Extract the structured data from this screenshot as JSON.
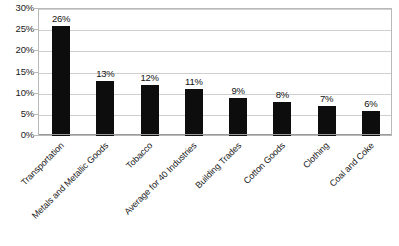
{
  "chart_data": {
    "type": "bar",
    "title": "",
    "subtitle": "",
    "xlabel": "",
    "ylabel": "",
    "categories": [
      "Transportation",
      "Metals and Metallic Goods",
      "Tobacco",
      "Average for 40 Industries",
      "Building Trades",
      "Cotton Goods",
      "Clothing",
      "Coal and Coke"
    ],
    "values": [
      26,
      13,
      12,
      11,
      9,
      8,
      7,
      6
    ],
    "data_labels": [
      "26%",
      "13%",
      "12%",
      "11%",
      "9%",
      "8%",
      "7%",
      "6%"
    ],
    "ylim": [
      0,
      30
    ],
    "ytick_values": [
      0,
      5,
      10,
      15,
      20,
      25,
      30
    ],
    "ytick_labels": [
      "0%",
      "5%",
      "10%",
      "15%",
      "20%",
      "25%",
      "30%"
    ],
    "grid": true,
    "legend": "none",
    "legend_position": "none",
    "bar_color": "#0d0d0d",
    "gridline_color": "#cfcfcf",
    "border_color": "#b9b9b9",
    "background_color": "#ffffff",
    "xtick_label_rotation": -45
  }
}
